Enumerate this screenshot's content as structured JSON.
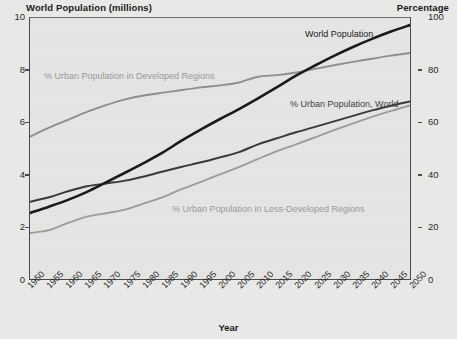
{
  "chart_data": {
    "type": "line",
    "title": "",
    "xlabel": "Year",
    "ylabel_left": "World Population (millions)",
    "ylabel_right": "Percentage",
    "x": [
      1950,
      1955,
      1960,
      1965,
      1970,
      1975,
      1980,
      1985,
      1990,
      1995,
      2000,
      2005,
      2010,
      2015,
      2020,
      2025,
      2030,
      2035,
      2040,
      2045,
      2050
    ],
    "xlim": [
      1950,
      2050
    ],
    "ylim_left": [
      0,
      10
    ],
    "ylim_right": [
      0,
      100
    ],
    "yticks_left": [
      0,
      2,
      4,
      6,
      8,
      10
    ],
    "yticks_right": [
      0,
      20,
      40,
      60,
      80,
      100
    ],
    "grid": false,
    "legend": "inline-labels",
    "series": [
      {
        "name": "World Population",
        "axis": "left",
        "units": "billions (axis labeled millions)",
        "color": "#1a1a1a",
        "width": 2.6,
        "values": [
          2.53,
          2.77,
          3.03,
          3.34,
          3.7,
          4.07,
          4.45,
          4.85,
          5.31,
          5.73,
          6.13,
          6.51,
          6.92,
          7.35,
          7.79,
          8.18,
          8.55,
          8.89,
          9.2,
          9.48,
          9.73
        ]
      },
      {
        "name": "% Urban Population in Developed Regions",
        "axis": "right",
        "units": "percent",
        "color": "#8f8f8f",
        "width": 1.9,
        "values": [
          54.5,
          58.0,
          61.0,
          64.0,
          66.6,
          68.8,
          70.3,
          71.4,
          72.4,
          73.4,
          74.2,
          75.3,
          77.5,
          78.1,
          79.1,
          80.5,
          81.9,
          83.2,
          84.4,
          85.6,
          86.6
        ]
      },
      {
        "name": "% Urban Population, World",
        "axis": "right",
        "units": "percent",
        "color": "#3a3a3a",
        "width": 2.0,
        "values": [
          29.6,
          31.3,
          33.6,
          35.5,
          36.6,
          37.7,
          39.3,
          41.2,
          43.0,
          44.7,
          46.6,
          48.6,
          51.6,
          53.9,
          56.2,
          58.3,
          60.4,
          62.5,
          64.6,
          66.4,
          68.0
        ]
      },
      {
        "name": "% Urban Population in Less-Developed Regions",
        "axis": "right",
        "units": "percent",
        "color": "#9d9d9d",
        "width": 1.9,
        "values": [
          17.6,
          18.7,
          21.5,
          23.9,
          25.2,
          26.6,
          29.0,
          31.4,
          34.5,
          37.2,
          40.1,
          42.9,
          46.0,
          49.0,
          51.6,
          54.3,
          57.0,
          59.6,
          62.1,
          64.4,
          66.5
        ]
      }
    ]
  },
  "labels": {
    "title_left": "World Population (millions)",
    "title_right": "Percentage",
    "xaxis_title": "Year",
    "series": {
      "world_population": "World Population",
      "urban_developed": "% Urban Population in Developed Regions",
      "urban_world": "% Urban Population, World",
      "urban_less_developed": "% Urban Population in Less-Developed Regions"
    }
  },
  "colors": {
    "background": "#e9e9e7",
    "plot_background": "#e5e5e3",
    "axis": "#4a4a4a",
    "world_population": "#1a1a1a",
    "urban_developed": "#8f8f8f",
    "urban_world": "#3a3a3a",
    "urban_less_developed": "#9d9d9d",
    "text": "#1b1b1b"
  }
}
